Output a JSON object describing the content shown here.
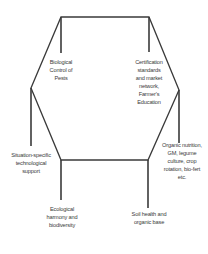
{
  "diagram": {
    "type": "hexagon-concept-map",
    "line_color": "#3a3a3a",
    "nodes": [
      {
        "id": "bio-control",
        "lines": [
          "Biological",
          "Control of",
          "Pests"
        ]
      },
      {
        "id": "certification",
        "lines": [
          "Certification",
          "standards",
          "and market",
          "network,",
          "Farmer's",
          "Education"
        ]
      },
      {
        "id": "tech-support",
        "lines": [
          "Situation-specific",
          "technological",
          "support"
        ]
      },
      {
        "id": "organic-nutrition",
        "lines": [
          "Organic nutrition,",
          "GM, legume",
          "culture, crop",
          "rotation, bio-fert",
          "etc."
        ]
      },
      {
        "id": "ecological-harmony",
        "lines": [
          "Ecological",
          "harmony and",
          "biodiversity"
        ]
      },
      {
        "id": "soil-health",
        "lines": [
          "Soil health and",
          "organic base"
        ]
      }
    ]
  }
}
